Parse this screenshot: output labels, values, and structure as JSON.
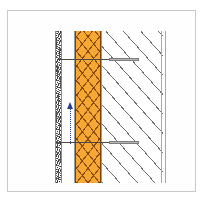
{
  "figure": {
    "type": "architectural-wall-section-detail",
    "orientation": "vertical section",
    "background_color": "#ffffff",
    "frame_color": "#c9c9c9"
  },
  "layers": [
    {
      "id": "finish",
      "name": "exterior-finish-layer",
      "label": "Exterior finish / render",
      "pattern": "stipple",
      "color": "#f7f7f5",
      "line_color": "#3a3a3a"
    },
    {
      "id": "cavity",
      "name": "cavity-air-gap",
      "label": "Ventilated cavity",
      "pattern": "blank",
      "color": "#ffffff",
      "line_color": "#9a9a9a"
    },
    {
      "id": "insulation",
      "name": "insulation-layer",
      "label": "Insulation",
      "pattern": "cross-hatch",
      "color": "#f6a833",
      "line_color": "#7a4206"
    },
    {
      "id": "structure",
      "name": "structural-wall",
      "label": "Structural masonry wall",
      "pattern": "diagonal-hatch",
      "color": "#ffffff",
      "line_color": "#6f6f6f"
    }
  ],
  "annotations": {
    "ties": [
      {
        "id": "tie-upper",
        "name": "wall-tie-upper",
        "label": "Wall tie"
      },
      {
        "id": "tie-lower",
        "name": "wall-tie-lower",
        "label": "Wall tie"
      }
    ],
    "arrow": {
      "name": "airflow-arrow",
      "label": "Air flow direction",
      "direction": "up",
      "style": "dotted",
      "color": "#2a3f8f"
    }
  }
}
